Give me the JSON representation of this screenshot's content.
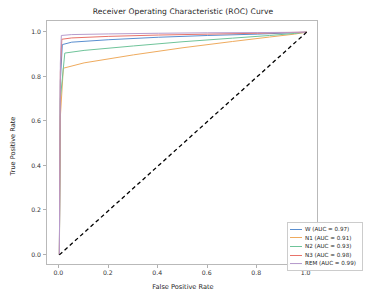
{
  "chart_data": {
    "type": "line",
    "title": "Receiver Operating Characteristic (ROC) Curve",
    "xlabel": "False Positive Rate",
    "ylabel": "True Positive Rate",
    "xlim": [
      -0.05,
      1.05
    ],
    "ylim": [
      -0.05,
      1.05
    ],
    "xticks": [
      "0.0",
      "0.2",
      "0.4",
      "0.6",
      "0.8",
      "1.0"
    ],
    "xtick_values": [
      0.0,
      0.2,
      0.4,
      0.6,
      0.8,
      1.0
    ],
    "yticks": [
      "0.0",
      "0.2",
      "0.4",
      "0.6",
      "0.8",
      "1.0"
    ],
    "ytick_values": [
      0.0,
      0.2,
      0.4,
      0.6,
      0.8,
      1.0
    ],
    "grid": false,
    "legend_position": "lower right",
    "series": [
      {
        "name": "W",
        "auc": 0.97,
        "legend_label": "W (AUC = 0.97)",
        "color": "#5a8fd0",
        "x": [
          0.0,
          0.004,
          0.012,
          0.05,
          0.2,
          0.4,
          0.6,
          0.8,
          0.92,
          1.0
        ],
        "y": [
          0.0,
          0.78,
          0.944,
          0.955,
          0.966,
          0.977,
          0.985,
          0.991,
          0.996,
          1.0
        ]
      },
      {
        "name": "N1",
        "auc": 0.91,
        "legend_label": "N1 (AUC = 0.91)",
        "color": "#efab5e",
        "x": [
          0.0,
          0.004,
          0.016,
          0.1,
          0.3,
          0.5,
          0.7,
          0.85,
          0.95,
          1.0
        ],
        "y": [
          0.0,
          0.62,
          0.838,
          0.862,
          0.898,
          0.93,
          0.958,
          0.978,
          0.991,
          1.0
        ]
      },
      {
        "name": "N2",
        "auc": 0.93,
        "legend_label": "N2 (AUC = 0.93)",
        "color": "#6fc49a",
        "x": [
          0.0,
          0.004,
          0.022,
          0.1,
          0.3,
          0.5,
          0.7,
          0.85,
          0.95,
          1.0
        ],
        "y": [
          0.0,
          0.7,
          0.906,
          0.918,
          0.938,
          0.957,
          0.973,
          0.985,
          0.994,
          1.0
        ]
      },
      {
        "name": "N3",
        "auc": 0.98,
        "legend_label": "N3 (AUC = 0.98)",
        "color": "#e8736a",
        "x": [
          0.0,
          0.004,
          0.01,
          0.05,
          0.2,
          0.4,
          0.6,
          0.8,
          0.92,
          1.0
        ],
        "y": [
          0.0,
          0.82,
          0.968,
          0.974,
          0.981,
          0.987,
          0.991,
          0.995,
          0.998,
          1.0
        ]
      },
      {
        "name": "REM",
        "auc": 0.99,
        "legend_label": "REM (AUC = 0.99)",
        "color": "#b79ccd",
        "x": [
          0.0,
          0.004,
          0.008,
          0.05,
          0.2,
          0.4,
          0.6,
          0.8,
          0.92,
          1.0
        ],
        "y": [
          0.0,
          0.86,
          0.985,
          0.989,
          0.992,
          0.995,
          0.997,
          0.998,
          0.999,
          1.0
        ]
      }
    ],
    "reference_line": {
      "name": "chance-diagonal",
      "style": "dashed",
      "color": "#000000",
      "x": [
        0.0,
        1.0
      ],
      "y": [
        0.0,
        1.0
      ]
    }
  }
}
